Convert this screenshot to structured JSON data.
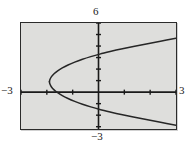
{
  "figure": {
    "title": "",
    "window_labels": {
      "top": "6",
      "left": "−3",
      "right": "3",
      "bottom": "−3"
    },
    "colors": {
      "plot_background": "#dededc",
      "frame": "#2b2b2b",
      "axis": "#1a1a1a",
      "curve": "#262626",
      "page_background": "#ffffff"
    }
  },
  "chart_data": {
    "type": "line",
    "title": "",
    "xlabel": "",
    "ylabel": "",
    "xlim": [
      -3,
      3
    ],
    "ylim": [
      -3.2,
      6
    ],
    "grid": false,
    "legend": null,
    "axis_tick_labels": {
      "x": [
        "-3",
        "3"
      ],
      "y": [
        "-3",
        "6"
      ]
    },
    "x_tick_interval": 1,
    "y_tick_interval": 1,
    "curves": [
      {
        "name": "upper-branch",
        "points_xy": [
          [
            -1.9,
            0.9
          ],
          [
            -1.88,
            1.1
          ],
          [
            -1.82,
            1.35
          ],
          [
            -1.72,
            1.6
          ],
          [
            -1.58,
            1.85
          ],
          [
            -1.4,
            2.1
          ],
          [
            -1.18,
            2.35
          ],
          [
            -0.92,
            2.6
          ],
          [
            -0.62,
            2.85
          ],
          [
            -0.3,
            3.08
          ],
          [
            0.05,
            3.3
          ],
          [
            0.45,
            3.52
          ],
          [
            0.88,
            3.74
          ],
          [
            1.35,
            3.96
          ],
          [
            1.85,
            4.18
          ],
          [
            2.4,
            4.42
          ],
          [
            3.0,
            4.68
          ]
        ]
      },
      {
        "name": "lower-branch",
        "points_xy": [
          [
            -1.9,
            0.9
          ],
          [
            -1.88,
            0.7
          ],
          [
            -1.82,
            0.45
          ],
          [
            -1.72,
            0.2
          ],
          [
            -1.58,
            -0.05
          ],
          [
            -1.4,
            -0.3
          ],
          [
            -1.18,
            -0.55
          ],
          [
            -0.92,
            -0.8
          ],
          [
            -0.62,
            -1.05
          ],
          [
            -0.3,
            -1.28
          ],
          [
            0.05,
            -1.5
          ],
          [
            0.45,
            -1.72
          ],
          [
            0.88,
            -1.94
          ],
          [
            1.35,
            -2.16
          ],
          [
            1.85,
            -2.38
          ],
          [
            2.4,
            -2.62
          ],
          [
            3.0,
            -2.88
          ]
        ]
      }
    ]
  }
}
